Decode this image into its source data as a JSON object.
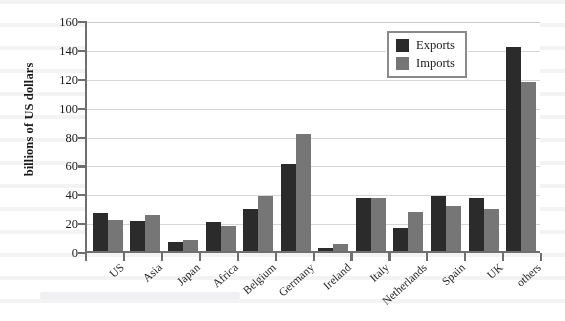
{
  "chart_data": {
    "type": "bar",
    "title": "",
    "xlabel": "",
    "ylabel": "billions of US dollars",
    "ylim": [
      0,
      160
    ],
    "yticks": [
      0,
      20,
      40,
      60,
      80,
      100,
      120,
      140,
      160
    ],
    "grid": true,
    "legend_position": "top-right",
    "categories": [
      "US",
      "Asia",
      "Japan",
      "Africa",
      "Belgium",
      "Germany",
      "Ireland",
      "Italy",
      "Netherlands",
      "Spain",
      "UK",
      "others"
    ],
    "series": [
      {
        "name": "Exports",
        "color": "#2b2b2b",
        "values": [
          26,
          21,
          6,
          20,
          29,
          60,
          2,
          37,
          16,
          38,
          37,
          141
        ]
      },
      {
        "name": "Imports",
        "color": "#767676",
        "values": [
          21.5,
          25,
          7.5,
          17,
          38,
          81,
          5,
          37,
          27,
          31,
          29,
          117
        ]
      }
    ]
  },
  "axis": {
    "color": "#6f6f6f",
    "gridline_color": "#d6d6d6"
  }
}
